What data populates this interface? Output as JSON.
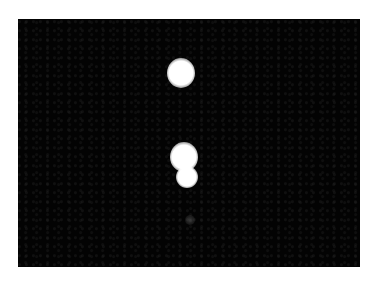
{
  "image": {
    "description": "Fluorescence-style micrograph: bright white spots on black background",
    "background_color": "#030303",
    "spot_color": "#ffffff",
    "spots": [
      {
        "name": "top-spot",
        "cx": 163,
        "cy": 54,
        "w": 28,
        "h": 30
      },
      {
        "name": "middle-spot",
        "cx": 166,
        "cy": 138,
        "w": 28,
        "h": 30
      },
      {
        "name": "lower-spot",
        "cx": 169,
        "cy": 158,
        "w": 22,
        "h": 22
      }
    ],
    "faint_spots": [
      {
        "name": "faint-spot",
        "cx": 172,
        "cy": 201,
        "w": 10,
        "h": 10
      }
    ]
  }
}
